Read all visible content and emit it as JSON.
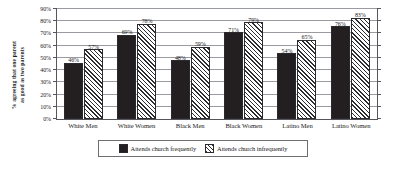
{
  "chart_data": {
    "type": "bar",
    "title": "",
    "xlabel": "",
    "ylabel_line1": "% agreeing that one parent",
    "ylabel_line2": "as good as two parents",
    "categories": [
      "White Men",
      "White Women",
      "Black Men",
      "Black Women",
      "Latino Men",
      "Latino Women"
    ],
    "series": [
      {
        "name": "Attends church frequently",
        "values": [
          46,
          69,
          48,
          71,
          54,
          76
        ],
        "value_labels": [
          "46%",
          "69%",
          "48%",
          "71%",
          "54%",
          "76%"
        ],
        "fill": "solid-dark",
        "color": "#231f20"
      },
      {
        "name": "Attends church infrequently",
        "values": [
          57,
          78,
          59,
          79,
          65,
          83
        ],
        "value_labels": [
          "57%",
          "78%",
          "59%",
          "79%",
          "65%",
          "83%"
        ],
        "fill": "diagonal-hatch",
        "color": "#d8d8d8"
      }
    ],
    "ylim": [
      0,
      90
    ],
    "ytick_values": [
      0,
      10,
      20,
      30,
      40,
      50,
      60,
      70,
      80,
      90
    ],
    "ytick_labels": [
      "0%",
      "10%",
      "20%",
      "30%",
      "40%",
      "50%",
      "60%",
      "70%",
      "80%",
      "90%"
    ],
    "grid": true,
    "grid_axis": "y",
    "legend_position": "bottom",
    "legend_entries": [
      "Attends church frequently",
      "Attends church infrequently"
    ]
  }
}
